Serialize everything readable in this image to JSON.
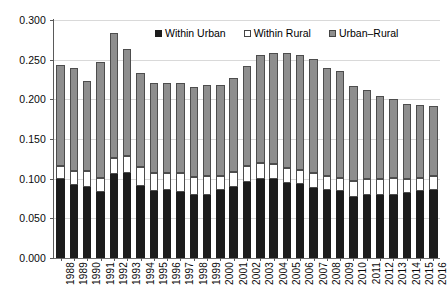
{
  "chart_data": {
    "type": "bar",
    "subtype": "stacked-bar",
    "title": "",
    "xlabel": "",
    "ylabel": "",
    "ylim": [
      0.0,
      0.3
    ],
    "ytick_labels": [
      "0.000",
      "0.050",
      "0.100",
      "0.150",
      "0.200",
      "0.250",
      "0.300"
    ],
    "ytick_values": [
      0.0,
      0.05,
      0.1,
      0.15,
      0.2,
      0.25,
      0.3
    ],
    "grid": true,
    "grid_axis": "y",
    "legend_position": "top-center",
    "categories": [
      "1988",
      "1989",
      "1990",
      "1991",
      "1992",
      "1993",
      "1994",
      "1995",
      "1996",
      "1997",
      "1998",
      "1999",
      "2000",
      "2001",
      "2002",
      "2003",
      "2004",
      "2005",
      "2006",
      "2007",
      "2008",
      "2009",
      "2010",
      "2011",
      "2012",
      "2013",
      "2014",
      "2015",
      "2016"
    ],
    "series": [
      {
        "name": "Within Urban",
        "color": "#1c1c1c",
        "values": [
          0.099,
          0.092,
          0.089,
          0.083,
          0.106,
          0.107,
          0.091,
          0.085,
          0.086,
          0.083,
          0.08,
          0.08,
          0.086,
          0.089,
          0.096,
          0.1,
          0.099,
          0.095,
          0.093,
          0.088,
          0.086,
          0.084,
          0.077,
          0.08,
          0.08,
          0.08,
          0.082,
          0.084,
          0.086
        ]
      },
      {
        "name": "Within Rural",
        "color": "#ffffff",
        "values": [
          0.017,
          0.018,
          0.021,
          0.018,
          0.02,
          0.022,
          0.024,
          0.022,
          0.021,
          0.024,
          0.022,
          0.023,
          0.018,
          0.019,
          0.02,
          0.02,
          0.019,
          0.019,
          0.018,
          0.019,
          0.017,
          0.017,
          0.02,
          0.019,
          0.02,
          0.021,
          0.017,
          0.017,
          0.018
        ]
      },
      {
        "name": "Urban–Rural",
        "color": "#8e8e8e",
        "values": [
          0.127,
          0.13,
          0.113,
          0.146,
          0.158,
          0.135,
          0.118,
          0.114,
          0.113,
          0.113,
          0.114,
          0.115,
          0.114,
          0.119,
          0.126,
          0.136,
          0.14,
          0.144,
          0.145,
          0.144,
          0.137,
          0.135,
          0.12,
          0.113,
          0.104,
          0.1,
          0.095,
          0.092,
          0.088
        ]
      }
    ],
    "totals": [
      0.243,
      0.24,
      0.223,
      0.247,
      0.284,
      0.264,
      0.233,
      0.221,
      0.22,
      0.22,
      0.216,
      0.218,
      0.218,
      0.227,
      0.242,
      0.256,
      0.258,
      0.258,
      0.256,
      0.251,
      0.24,
      0.236,
      0.217,
      0.212,
      0.204,
      0.201,
      0.194,
      0.193,
      0.192
    ]
  },
  "legend": {
    "items": [
      {
        "label": "Within Urban",
        "swatch": "black-square-icon"
      },
      {
        "label": "Within Rural",
        "swatch": "white-square-icon"
      },
      {
        "label": "Urban–Rural",
        "swatch": "gray-square-icon"
      }
    ]
  },
  "colors": {
    "within_urban": "#1c1c1c",
    "within_rural": "#ffffff",
    "urban_rural": "#8e8e8e",
    "gridline": "#d9d9d9",
    "axis": "#5a5a5a",
    "background": "#ffffff",
    "text": "#0a0a0a"
  }
}
